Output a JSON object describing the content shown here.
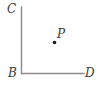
{
  "figure": {
    "background_color": "#ffffff",
    "stroke_color": "#8c8c8c",
    "point_color": "#1a1a1a",
    "label_color": "#3a3a3a",
    "labels": {
      "c": "C",
      "b": "B",
      "d": "D",
      "p": "P"
    }
  },
  "chart_data": {
    "type": "scatter",
    "title": "",
    "xlabel": "",
    "ylabel": "",
    "grid": false,
    "legend": null,
    "xlim": [
      0,
      102
    ],
    "ylim": [
      90,
      0
    ],
    "annotations": [
      {
        "label": "C",
        "x": 21.5,
        "y": 7,
        "role": "ray-endpoint-vertical"
      },
      {
        "label": "B",
        "x": 21.5,
        "y": 73.5,
        "role": "corner-vertex"
      },
      {
        "label": "D",
        "x": 84,
        "y": 73.5,
        "role": "ray-endpoint-horizontal"
      },
      {
        "label": "P",
        "x": 54.5,
        "y": 42.5,
        "role": "interior-point"
      }
    ],
    "segments": [
      {
        "name": "BC",
        "x1": 21.5,
        "y1": 7,
        "x2": 21.5,
        "y2": 73.5
      },
      {
        "name": "BD",
        "x1": 21.5,
        "y1": 73.5,
        "x2": 84,
        "y2": 73.5
      }
    ],
    "points": [
      {
        "name": "P",
        "x": 54.5,
        "y": 42.5,
        "marker": "filled-circle",
        "size": 3.6
      }
    ]
  }
}
